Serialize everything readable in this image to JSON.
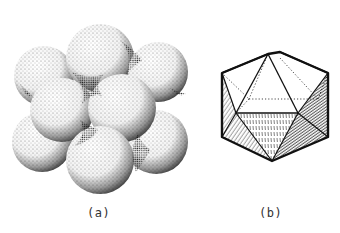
{
  "figure": {
    "panels": [
      {
        "id": "a",
        "label": "(a)",
        "description": "stippled cluster of close-packed spheres"
      },
      {
        "id": "b",
        "label": "(b)",
        "description": "icosahedron line drawing with hatched shaded faces and dotted hidden edges"
      }
    ]
  },
  "colors": {
    "ink": "#1a1a1a",
    "background": "#ffffff",
    "label": "#333333"
  }
}
